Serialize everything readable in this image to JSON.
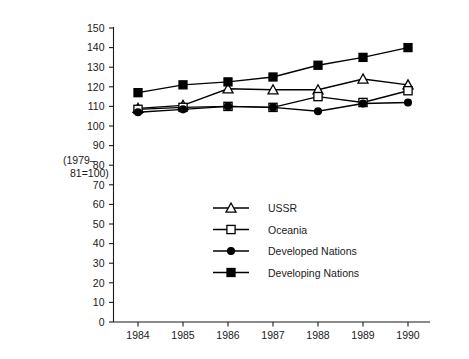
{
  "chart_data": {
    "type": "line",
    "title": "",
    "subtitle": "",
    "xlabel": "",
    "ylabel": "(1979–81=100)",
    "ylabel_line1": "(1979–",
    "ylabel_line2": "81=100)",
    "categories": [
      "1984",
      "1985",
      "1986",
      "1987",
      "1988",
      "1989",
      "1990"
    ],
    "x": [
      1984,
      1985,
      1986,
      1987,
      1988,
      1989,
      1990
    ],
    "ylim": [
      0,
      150
    ],
    "ytick_step": 10,
    "ytick_labels": [
      "0",
      "10",
      "20",
      "30",
      "40",
      "50",
      "60",
      "70",
      "80",
      "90",
      "100",
      "110",
      "120",
      "130",
      "140",
      "150"
    ],
    "grid": false,
    "legend_position": "center",
    "series": [
      {
        "name": "USSR",
        "marker": "open-triangle",
        "color": "#000000",
        "values": [
          109,
          110.5,
          119,
          118.5,
          118.5,
          124,
          121
        ]
      },
      {
        "name": "Oceania",
        "marker": "open-square",
        "color": "#000000",
        "values": [
          108.5,
          109.5,
          110,
          109.5,
          115,
          112,
          118
        ]
      },
      {
        "name": "Developed Nations",
        "marker": "filled-circle",
        "color": "#000000",
        "values": [
          107,
          108.5,
          110,
          109.5,
          107.5,
          111.5,
          112
        ]
      },
      {
        "name": "Developing Nations",
        "marker": "filled-square",
        "color": "#000000",
        "values": [
          117,
          121,
          122.5,
          125,
          131,
          135,
          140
        ]
      }
    ]
  },
  "legend": {
    "entries": [
      {
        "label": "USSR",
        "marker": "open-triangle"
      },
      {
        "label": "Oceania",
        "marker": "open-square"
      },
      {
        "label": "Developed Nations",
        "marker": "filled-circle"
      },
      {
        "label": "Developing Nations",
        "marker": "filled-square"
      }
    ]
  }
}
